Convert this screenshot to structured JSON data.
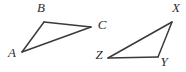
{
  "figure": {
    "background_color": "#ffffff",
    "stroke_color": "#3a3a3a",
    "label_color": "#2e2e2e",
    "stroke_width": 1.5,
    "canvas": {
      "width": 186,
      "height": 72
    },
    "shapes": [
      {
        "name": "triangle-abc",
        "kind": "triangle",
        "vertices": [
          {
            "label": "A",
            "x": 22,
            "y": 52,
            "label_x": 12,
            "label_y": 54
          },
          {
            "label": "B",
            "x": 44,
            "y": 22,
            "label_x": 41,
            "label_y": 9
          },
          {
            "label": "C",
            "x": 91,
            "y": 27,
            "label_x": 102,
            "label_y": 26
          }
        ],
        "edges": [
          {
            "name": "edge-ab",
            "from": "A",
            "to": "B"
          },
          {
            "name": "edge-bc",
            "from": "B",
            "to": "C"
          },
          {
            "name": "edge-ca",
            "from": "C",
            "to": "A"
          }
        ]
      },
      {
        "name": "triangle-xyz",
        "kind": "triangle",
        "vertices": [
          {
            "label": "X",
            "x": 172,
            "y": 22,
            "label_x": 176,
            "label_y": 9
          },
          {
            "label": "Y",
            "x": 158,
            "y": 57,
            "label_x": 164,
            "label_y": 63
          },
          {
            "label": "Z",
            "x": 108,
            "y": 58,
            "label_x": 99,
            "label_y": 56
          }
        ],
        "edges": [
          {
            "name": "edge-zx",
            "from": "Z",
            "to": "X"
          },
          {
            "name": "edge-xy",
            "from": "X",
            "to": "Y"
          },
          {
            "name": "edge-yz",
            "from": "Y",
            "to": "Z"
          }
        ]
      }
    ]
  }
}
